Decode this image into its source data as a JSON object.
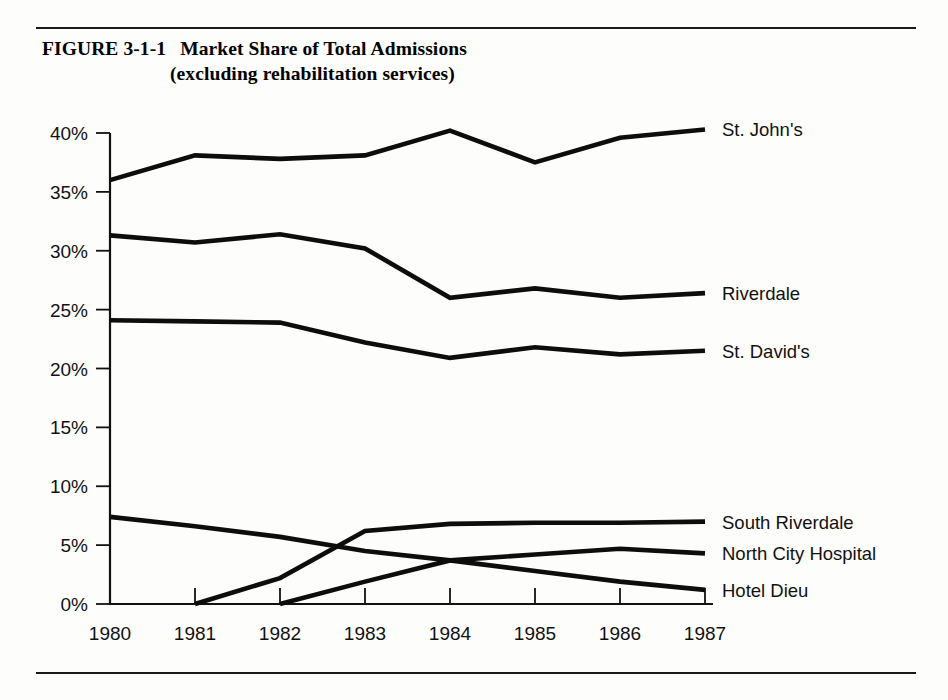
{
  "figure": {
    "number": "FIGURE 3-1-1",
    "title_line1": "Market Share of Total Admissions",
    "title_line2": "(excluding rehabilitation services)"
  },
  "chart_data": {
    "type": "line",
    "title": "Market Share of Total Admissions (excluding rehabilitation services)",
    "xlabel": "",
    "ylabel": "",
    "xlim": [
      1980,
      1987
    ],
    "ylim": [
      0,
      40
    ],
    "grid": false,
    "legend_position": "right-inline",
    "ytick_labels": [
      "0%",
      "5%",
      "10%",
      "15%",
      "20%",
      "25%",
      "30%",
      "35%",
      "40%"
    ],
    "ytick_values": [
      0,
      5,
      10,
      15,
      20,
      25,
      30,
      35,
      40
    ],
    "categories": [
      "1980",
      "1981",
      "1982",
      "1983",
      "1984",
      "1985",
      "1986",
      "1987"
    ],
    "x": [
      1980,
      1981,
      1982,
      1983,
      1984,
      1985,
      1986,
      1987
    ],
    "series": [
      {
        "name": "St. John's",
        "values": [
          36.0,
          38.1,
          37.8,
          38.1,
          40.2,
          37.5,
          39.6,
          40.3
        ]
      },
      {
        "name": "Riverdale",
        "values": [
          31.3,
          30.7,
          31.4,
          30.2,
          26.0,
          26.8,
          26.0,
          26.4
        ]
      },
      {
        "name": "St. David's",
        "values": [
          24.1,
          24.0,
          23.9,
          22.2,
          20.9,
          21.8,
          21.2,
          21.5
        ]
      },
      {
        "name": "South Riverdale",
        "values": [
          null,
          0.0,
          2.2,
          6.2,
          6.8,
          6.9,
          6.9,
          7.0
        ]
      },
      {
        "name": "North City Hospital",
        "values": [
          null,
          null,
          0.0,
          1.9,
          3.7,
          4.2,
          4.7,
          4.3
        ]
      },
      {
        "name": "Hotel Dieu",
        "values": [
          7.4,
          6.6,
          5.7,
          4.5,
          3.7,
          2.8,
          1.9,
          1.2
        ]
      }
    ]
  }
}
